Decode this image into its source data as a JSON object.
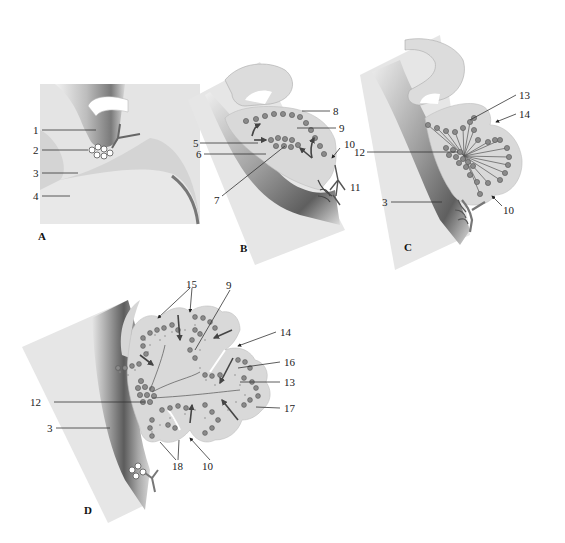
{
  "figure": {
    "panels": [
      {
        "id": "A",
        "label": "A",
        "callouts": [
          "1",
          "2",
          "3",
          "4"
        ]
      },
      {
        "id": "B",
        "label": "B",
        "callouts": [
          "5",
          "6",
          "7",
          "8",
          "9",
          "10",
          "11"
        ]
      },
      {
        "id": "C",
        "label": "C",
        "callouts": [
          "13",
          "14",
          "12",
          "3",
          "10"
        ]
      },
      {
        "id": "D",
        "label": "D",
        "callouts": [
          "15",
          "9",
          "14",
          "16",
          "13",
          "12",
          "17",
          "3",
          "18",
          "10"
        ]
      }
    ]
  },
  "panelA": {
    "label": "A",
    "callouts": {
      "c1": "1",
      "c2": "2",
      "c3": "3",
      "c4": "4"
    }
  },
  "panelB": {
    "label": "B",
    "callouts": {
      "c5": "5",
      "c6": "6",
      "c7": "7",
      "c8": "8",
      "c9": "9",
      "c10": "10",
      "c11": "11"
    }
  },
  "panelC": {
    "label": "C",
    "callouts": {
      "c13": "13",
      "c14": "14",
      "c12": "12",
      "c3": "3",
      "c10": "10"
    }
  },
  "panelD": {
    "label": "D",
    "callouts": {
      "c15": "15",
      "c9": "9",
      "c14": "14",
      "c16": "16",
      "c13": "13",
      "c12": "12",
      "c17": "17",
      "c3": "3",
      "c18": "18",
      "c10": "10"
    }
  },
  "colors": {
    "background": "#ffffff",
    "tissue_light": "#e3e3e3",
    "tissue_mid": "#cfcfcf",
    "tissue_dark": "#6f6f6f",
    "cells": "#8a8a8a",
    "text": "#222222"
  }
}
